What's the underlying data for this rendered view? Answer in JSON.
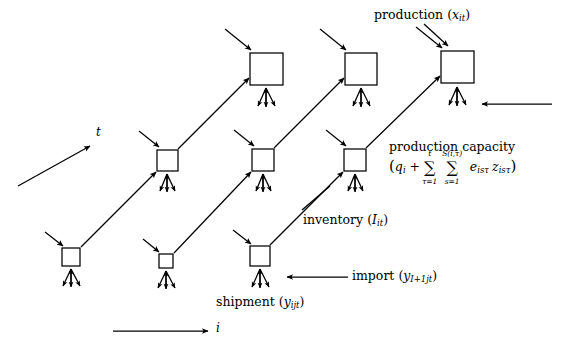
{
  "figure": {
    "type": "diagram",
    "title": ""
  },
  "axes": {
    "time": {
      "label": "t",
      "direction": "up-right",
      "arrow": "arrow-icon"
    },
    "location": {
      "label": "i",
      "direction": "right",
      "arrow": "arrow-icon"
    }
  },
  "annotations": {
    "production": {
      "text": "production",
      "symbol_open": "(",
      "symbol_base": "x",
      "symbol_sub": "it",
      "symbol_close": ")"
    },
    "production_capacity": {
      "text": "production capacity",
      "formula_parts": {
        "open": "(",
        "q": "q",
        "q_sub": "i",
        "plus": "+",
        "sum1_symbol": "∑",
        "sum1_lower": "τ=1",
        "sum1_upper": "t",
        "sum2_symbol": "∑",
        "sum2_lower": "s=1",
        "sum2_upper": "S(i,τ)",
        "e": "e",
        "e_sub": "isτ",
        "z": "z",
        "z_sub": "isτ",
        "close": ")"
      },
      "formula_plain": "(q_i + ∑_{τ=1}^{t} ∑_{s=1}^{S(i,τ)} e_{isτ} z_{isτ})"
    },
    "inventory": {
      "text": "inventory",
      "symbol_open": "(",
      "symbol_base": "I",
      "symbol_sub": "it",
      "symbol_close": ")"
    },
    "import": {
      "text": "import",
      "symbol_open": "(",
      "symbol_base": "y",
      "symbol_sub": "I+1jt",
      "symbol_close": ")"
    },
    "shipment": {
      "text": "shipment",
      "symbol_open": "(",
      "symbol_base": "y",
      "symbol_sub": "ijt",
      "symbol_close": ")"
    }
  },
  "nodes": [
    {
      "name": "node-row3-col1",
      "x": 62,
      "y": 248,
      "size": 18,
      "row": "bottom",
      "col": 1
    },
    {
      "name": "node-row3-col2",
      "x": 159,
      "y": 254,
      "size": 14,
      "row": "bottom",
      "col": 2
    },
    {
      "name": "node-row3-col3",
      "x": 250,
      "y": 246,
      "size": 20,
      "row": "bottom",
      "col": 3
    },
    {
      "name": "node-row2-col1",
      "x": 157,
      "y": 150,
      "size": 21,
      "row": "middle",
      "col": 1
    },
    {
      "name": "node-row2-col2",
      "x": 252,
      "y": 149,
      "size": 22,
      "row": "middle",
      "col": 2
    },
    {
      "name": "node-row2-col3",
      "x": 344,
      "y": 149,
      "size": 22,
      "row": "middle",
      "col": 3
    },
    {
      "name": "node-row1-col1",
      "x": 250,
      "y": 53,
      "size": 33,
      "row": "top",
      "col": 1
    },
    {
      "name": "node-row1-col2",
      "x": 345,
      "y": 53,
      "size": 32,
      "row": "top",
      "col": 2
    },
    {
      "name": "node-row1-col3",
      "x": 441,
      "y": 51,
      "size": 33,
      "row": "top",
      "col": 3
    }
  ],
  "colors": {
    "background": "#ffffff",
    "stroke": "#000000",
    "text": "#000000"
  }
}
